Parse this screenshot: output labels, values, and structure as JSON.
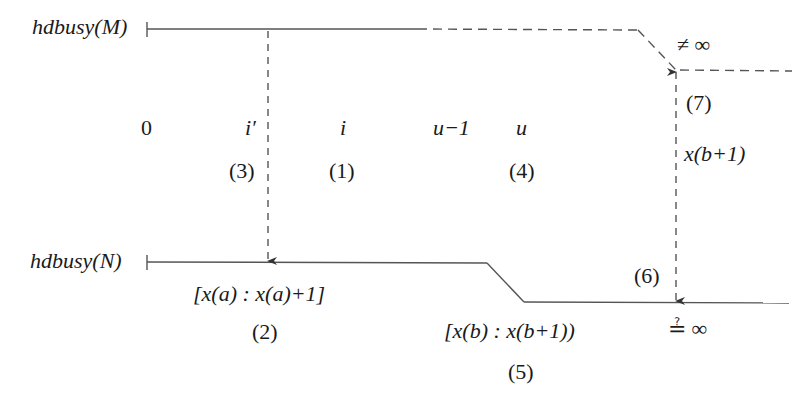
{
  "diagram": {
    "rows": [
      {
        "label": "hdbusy(M)"
      },
      {
        "label": "hdbusy(N)"
      }
    ],
    "positions": [
      "0",
      "i′",
      "i",
      "u−1",
      "u"
    ],
    "steps": {
      "s1": "(1)",
      "s2": "(2)",
      "s3": "(3)",
      "s4": "(4)",
      "s5": "(5)",
      "s6": "(6)",
      "s7": "(7)"
    },
    "annotations": {
      "interval_a": "[x(a) : x(a)+1]",
      "interval_b": "[x(b) : x(b+1))",
      "x_b_plus_1": "x(b+1)",
      "not_infinity": "≠ ∞",
      "maybe_equal_infinity": "≟ ∞"
    },
    "colors": {
      "line": "#555555",
      "text": "#1a1a1a"
    }
  }
}
